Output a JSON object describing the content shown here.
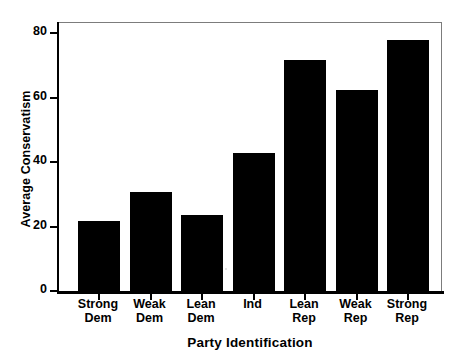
{
  "chart_data": {
    "type": "bar",
    "title": "",
    "xlabel": "Party Identification",
    "ylabel": "Average Conservatism",
    "categories": [
      "Strong\nDem",
      "Weak\nDem",
      "Lean\nDem",
      "Ind",
      "Lean\nRep",
      "Weak\nRep",
      "Strong\nRep"
    ],
    "category_labels_flat": [
      "Strong Dem",
      "Weak Dem",
      "Lean Dem",
      "Ind",
      "Lean Rep",
      "Weak Rep",
      "Strong Rep"
    ],
    "values": [
      22,
      31,
      24,
      43,
      72,
      62.5,
      78
    ],
    "ylim": [
      0,
      84
    ],
    "yticks": [
      0,
      20,
      40,
      60,
      80
    ],
    "ytick_labels": [
      "0",
      "20",
      "40",
      "60",
      "80"
    ],
    "xlim_note": "categorical",
    "grid": false,
    "legend": null,
    "bar_color": "#000000",
    "frame_color": "#7c7c7c",
    "axis_color": "#000000",
    "background": "#ffffff"
  },
  "axes": {
    "y_title": "Average Conservatism",
    "x_title": "Party Identification"
  }
}
